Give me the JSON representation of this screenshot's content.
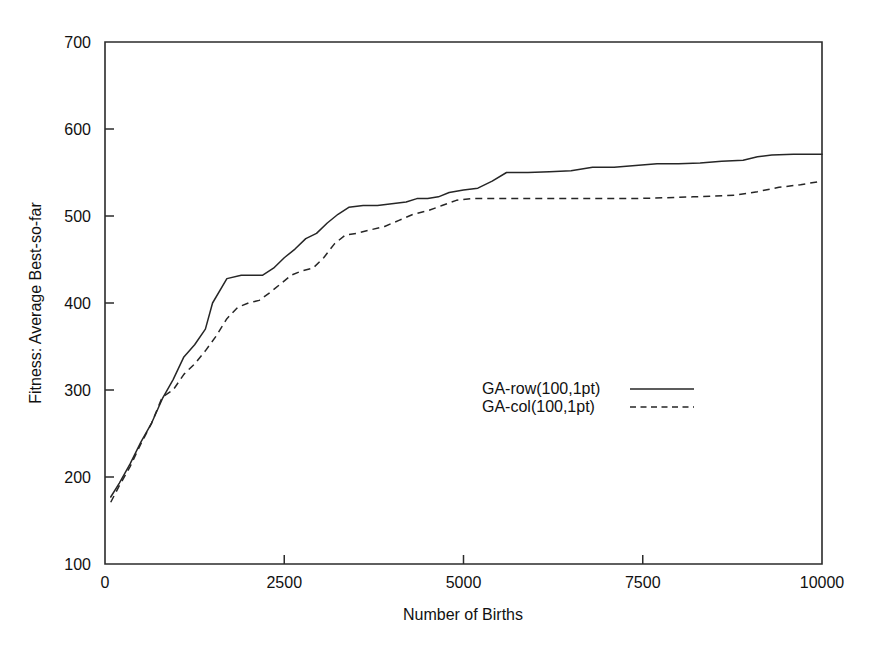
{
  "chart_data": {
    "type": "line",
    "title": "",
    "xlabel": "Number of Births",
    "ylabel": "Fitness: Average Best-so-far",
    "xlim": [
      0,
      10000
    ],
    "ylim": [
      100,
      700
    ],
    "xticks": [
      0,
      2500,
      5000,
      7500,
      10000
    ],
    "yticks": [
      100,
      200,
      300,
      400,
      500,
      600,
      700
    ],
    "xtick_labels": [
      "0",
      "2500",
      "5000",
      "7500",
      "10000"
    ],
    "ytick_labels": [
      "100",
      "200",
      "300",
      "400",
      "500",
      "600",
      "700"
    ],
    "grid": false,
    "legend_position": "center",
    "series": [
      {
        "name": "GA-row(100,1pt)",
        "style": "solid",
        "color": "#262626",
        "x": [
          80,
          200,
          350,
          500,
          650,
          800,
          950,
          1100,
          1250,
          1400,
          1500,
          1700,
          1900,
          2050,
          2200,
          2350,
          2500,
          2650,
          2800,
          2950,
          3100,
          3250,
          3400,
          3600,
          3800,
          4000,
          4200,
          4350,
          4500,
          4650,
          4800,
          5000,
          5200,
          5400,
          5600,
          5900,
          6200,
          6500,
          6800,
          7100,
          7400,
          7700,
          8000,
          8300,
          8600,
          8900,
          9100,
          9300,
          9600,
          10000
        ],
        "y": [
          177,
          193,
          215,
          240,
          262,
          290,
          312,
          338,
          352,
          370,
          400,
          428,
          432,
          432,
          432,
          440,
          452,
          462,
          474,
          480,
          492,
          502,
          510,
          512,
          512,
          514,
          516,
          520,
          520,
          522,
          527,
          530,
          532,
          540,
          550,
          550,
          551,
          552,
          556,
          556,
          558,
          560,
          560,
          561,
          563,
          564,
          568,
          570,
          571,
          571
        ]
      },
      {
        "name": "GA-col(100,1pt)",
        "style": "dashed",
        "color": "#262626",
        "x": [
          80,
          200,
          350,
          500,
          650,
          800,
          950,
          1100,
          1250,
          1400,
          1550,
          1700,
          1850,
          2000,
          2150,
          2300,
          2450,
          2600,
          2750,
          2900,
          3050,
          3200,
          3350,
          3500,
          3700,
          3900,
          4100,
          4300,
          4500,
          4700,
          4900,
          5100,
          5400,
          5800,
          6200,
          6600,
          7000,
          7400,
          7800,
          8200,
          8500,
          8800,
          9100,
          9400,
          9700,
          10000
        ],
        "y": [
          171,
          190,
          212,
          238,
          262,
          292,
          300,
          318,
          330,
          345,
          362,
          382,
          395,
          400,
          403,
          412,
          422,
          432,
          437,
          440,
          452,
          468,
          478,
          480,
          484,
          488,
          495,
          502,
          506,
          512,
          518,
          520,
          520,
          520,
          520,
          520,
          520,
          520,
          521,
          522,
          523,
          524,
          528,
          533,
          536,
          540
        ]
      }
    ]
  },
  "legend": {
    "entries": [
      {
        "label": "GA-row(100,1pt)",
        "style": "solid"
      },
      {
        "label": "GA-col(100,1pt)",
        "style": "dashed"
      }
    ]
  }
}
